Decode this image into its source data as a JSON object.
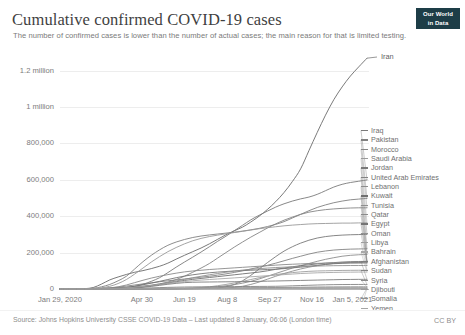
{
  "header": {
    "title": "Cumulative confirmed COVID-19 cases",
    "subtitle": "The number of confirmed cases is lower than the number of actual cases; the main reason for that is limited testing.",
    "logo_line1": "Our World",
    "logo_line2": "in Data"
  },
  "footer": {
    "source": "Source: Johns Hopkins University CSSE COVID-19 Data – Last updated 8 January, 06:06 (London time)",
    "license": "CC BY"
  },
  "highlight_label": "Iran",
  "chart_data": {
    "type": "line",
    "title": "Cumulative confirmed COVID-19 cases",
    "subtitle": "The number of confirmed cases is lower than the number of actual cases; the main reason for that is limited testing.",
    "xlabel": "",
    "ylabel": "",
    "grid": true,
    "legend_position": "right",
    "ylim": [
      0,
      1280000
    ],
    "ytick_labels": [
      "0",
      "200,000",
      "400,000",
      "600,000",
      "800,000",
      "1 million",
      "1.2 million"
    ],
    "ytick_values": [
      0,
      200000,
      400000,
      600000,
      800000,
      1000000,
      1200000
    ],
    "xtick_labels": [
      "Jan 29, 2020",
      "Apr 30",
      "Jun 19",
      "Aug 8",
      "Sep 27",
      "Nov 16",
      "Jan 5, 2021"
    ],
    "xtick_positions": [
      0,
      0.2685,
      0.4063,
      0.5441,
      0.6819,
      0.8197,
      0.9575
    ],
    "x_start": "Jan 29, 2020",
    "x_end": "Jan 5, 2021",
    "series": [
      {
        "name": "Iran",
        "color": "#6b6b6b",
        "end_value": 1268000,
        "values": [
          0,
          0,
          0,
          2000,
          8000,
          27000,
          50000,
          66000,
          80000,
          92000,
          101000,
          112000,
          125000,
          142000,
          164000,
          185000,
          205000,
          225000,
          248000,
          273000,
          298000,
          320000,
          340000,
          368000,
          400000,
          437000,
          480000,
          530000,
          590000,
          660000,
          760000,
          860000,
          955000,
          1040000,
          1110000,
          1170000,
          1220000,
          1268000
        ]
      },
      {
        "name": "Iraq",
        "color": "#7a7a7a",
        "end_value": 599000,
        "values": [
          0,
          0,
          0,
          200,
          800,
          1800,
          3000,
          5000,
          9000,
          15000,
          26000,
          42000,
          62000,
          90000,
          120000,
          148000,
          175000,
          203000,
          232000,
          262000,
          290000,
          320000,
          350000,
          380000,
          405000,
          428000,
          450000,
          468000,
          483000,
          495000,
          505000,
          520000,
          540000,
          560000,
          575000,
          585000,
          592000,
          599000
        ]
      },
      {
        "name": "Pakistan",
        "color": "#808080",
        "end_value": 498000,
        "values": [
          0,
          0,
          0,
          1000,
          4000,
          12000,
          25000,
          45000,
          70000,
          110000,
          150000,
          185000,
          215000,
          240000,
          258000,
          272000,
          283000,
          291000,
          297000,
          302000,
          307000,
          312000,
          318000,
          325000,
          333000,
          343000,
          355000,
          370000,
          390000,
          410000,
          430000,
          448000,
          462000,
          474000,
          483000,
          490000,
          494000,
          498000
        ]
      },
      {
        "name": "Morocco",
        "color": "#858585",
        "end_value": 446000,
        "values": [
          0,
          0,
          0,
          200,
          1000,
          3000,
          5000,
          7000,
          9000,
          12000,
          16000,
          21000,
          28000,
          38000,
          52000,
          70000,
          92000,
          115000,
          140000,
          170000,
          200000,
          230000,
          258000,
          285000,
          310000,
          335000,
          358000,
          378000,
          395000,
          410000,
          422000,
          430000,
          436000,
          440000,
          443000,
          445000,
          446000,
          446000
        ]
      },
      {
        "name": "Saudi Arabia",
        "color": "#9a9a9a",
        "end_value": 363000,
        "values": [
          0,
          0,
          0,
          500,
          2000,
          7000,
          15000,
          30000,
          52000,
          82000,
          115000,
          148000,
          178000,
          205000,
          228000,
          248000,
          265000,
          278000,
          288000,
          296000,
          303000,
          310000,
          317000,
          324000,
          331000,
          337000,
          342000,
          347000,
          351000,
          354000,
          357000,
          359000,
          360000,
          361000,
          362000,
          362000,
          363000,
          363000
        ]
      },
      {
        "name": "Jordan",
        "color": "#787878",
        "end_value": 300000,
        "values": [
          0,
          0,
          0,
          50,
          200,
          400,
          600,
          800,
          900,
          1000,
          1100,
          1200,
          1300,
          1400,
          1500,
          1700,
          2000,
          2500,
          3500,
          6000,
          12000,
          25000,
          45000,
          75000,
          110000,
          145000,
          178000,
          208000,
          232000,
          252000,
          268000,
          280000,
          288000,
          293000,
          296000,
          298000,
          299000,
          300000
        ]
      },
      {
        "name": "United Arab Emirates",
        "color": "#828282",
        "end_value": 221000,
        "values": [
          0,
          0,
          0,
          300,
          1200,
          3000,
          6000,
          10000,
          16000,
          22000,
          28000,
          34000,
          40000,
          45000,
          50000,
          55000,
          60000,
          65000,
          70000,
          76000,
          83000,
          91000,
          100000,
          110000,
          120000,
          130000,
          142000,
          155000,
          168000,
          180000,
          192000,
          202000,
          209000,
          214000,
          217000,
          219000,
          220000,
          221000
        ]
      },
      {
        "name": "Lebanon",
        "color": "#8c8c8c",
        "end_value": 190000,
        "values": [
          0,
          0,
          0,
          30,
          100,
          200,
          300,
          400,
          500,
          600,
          700,
          900,
          1200,
          1600,
          2200,
          3000,
          4200,
          6000,
          9000,
          13000,
          18000,
          24000,
          32000,
          42000,
          55000,
          70000,
          85000,
          100000,
          115000,
          128000,
          140000,
          152000,
          163000,
          172000,
          180000,
          185000,
          188000,
          190000
        ]
      },
      {
        "name": "Kuwait",
        "color": "#6f6f6f",
        "end_value": 152000,
        "values": [
          0,
          0,
          0,
          100,
          400,
          900,
          1500,
          2500,
          4000,
          7000,
          12000,
          18000,
          25000,
          33000,
          40000,
          47000,
          53000,
          58000,
          63000,
          68000,
          73000,
          78000,
          83000,
          88000,
          93000,
          100000,
          108000,
          115000,
          122000,
          128000,
          133000,
          138000,
          142000,
          145000,
          148000,
          150000,
          151000,
          152000
        ]
      },
      {
        "name": "Tunisia",
        "color": "#8f8f8f",
        "end_value": 149000,
        "values": [
          0,
          0,
          0,
          50,
          200,
          500,
          800,
          1000,
          1100,
          1150,
          1200,
          1250,
          1300,
          1350,
          1400,
          1500,
          1700,
          2000,
          2500,
          3500,
          5500,
          9000,
          15000,
          25000,
          38000,
          54000,
          70000,
          85000,
          98000,
          110000,
          120000,
          128000,
          135000,
          141000,
          145000,
          147000,
          148000,
          149000
        ]
      },
      {
        "name": "Qatar",
        "color": "#8a8a8a",
        "end_value": 144000,
        "values": [
          0,
          0,
          0,
          200,
          800,
          2500,
          6000,
          12000,
          22000,
          35000,
          48000,
          60000,
          70000,
          79000,
          87000,
          94000,
          99000,
          103000,
          107000,
          110000,
          113000,
          116000,
          119000,
          122000,
          125000,
          128000,
          131000,
          134000,
          136000,
          138000,
          140000,
          141000,
          142000,
          143000,
          143500,
          144000,
          144000,
          144000
        ]
      },
      {
        "name": "Egypt",
        "color": "#747474",
        "end_value": 144000,
        "values": [
          0,
          0,
          0,
          100,
          400,
          1000,
          2500,
          5000,
          9000,
          15000,
          23000,
          32000,
          42000,
          52000,
          62000,
          71000,
          78000,
          84000,
          89000,
          93000,
          96000,
          99000,
          101000,
          103000,
          105000,
          107000,
          109000,
          112000,
          116000,
          120000,
          125000,
          130000,
          135000,
          139000,
          141000,
          143000,
          143500,
          144000
        ]
      },
      {
        "name": "Oman",
        "color": "#909090",
        "end_value": 129000,
        "values": [
          0,
          0,
          0,
          80,
          300,
          800,
          1500,
          3000,
          5500,
          9000,
          14000,
          20000,
          27000,
          35000,
          44000,
          53000,
          62000,
          70000,
          78000,
          85000,
          92000,
          98000,
          104000,
          108000,
          112000,
          115000,
          118000,
          120000,
          122000,
          124000,
          125000,
          126000,
          127000,
          128000,
          128500,
          129000,
          129000,
          129000
        ]
      },
      {
        "name": "Libya",
        "color": "#9e9e9e",
        "end_value": 103000,
        "values": [
          0,
          0,
          0,
          0,
          20,
          50,
          80,
          100,
          130,
          180,
          250,
          400,
          700,
          1200,
          2000,
          3200,
          5000,
          8000,
          12000,
          18000,
          25000,
          33000,
          42000,
          52000,
          62000,
          71000,
          79000,
          85000,
          90000,
          94000,
          97000,
          99000,
          100000,
          101000,
          102000,
          102500,
          103000,
          103000
        ]
      },
      {
        "name": "Bahrain",
        "color": "#a8a8a8",
        "end_value": 93000,
        "values": [
          0,
          0,
          0,
          100,
          400,
          1000,
          2000,
          3500,
          6000,
          9000,
          13000,
          18000,
          24000,
          30000,
          36000,
          41000,
          45000,
          49000,
          52000,
          55000,
          58000,
          61000,
          64000,
          67000,
          70000,
          73000,
          76000,
          79000,
          82000,
          85000,
          87000,
          89000,
          90000,
          91000,
          92000,
          92500,
          93000,
          93000
        ]
      },
      {
        "name": "Afghanistan",
        "color": "#7d7d7d",
        "end_value": 53000,
        "values": [
          0,
          0,
          0,
          20,
          80,
          200,
          500,
          1200,
          2500,
          5000,
          9000,
          14000,
          20000,
          26000,
          31000,
          35000,
          37000,
          38000,
          38500,
          39000,
          39500,
          40000,
          40500,
          41000,
          42000,
          43000,
          44000,
          45000,
          46000,
          47000,
          48000,
          49000,
          50000,
          51000,
          52000,
          52500,
          53000,
          53000
        ]
      },
      {
        "name": "Sudan",
        "color": "#858585",
        "end_value": 25000,
        "values": [
          0,
          0,
          0,
          0,
          20,
          80,
          200,
          500,
          1000,
          2000,
          3500,
          5500,
          7500,
          9000,
          10000,
          11000,
          11500,
          12000,
          12300,
          12600,
          13000,
          13300,
          13600,
          13900,
          14200,
          14500,
          15000,
          16000,
          17500,
          19000,
          20500,
          22000,
          23000,
          24000,
          24500,
          24800,
          25000,
          25000
        ]
      },
      {
        "name": "Syria",
        "color": "#8b8b8b",
        "end_value": 12000,
        "values": [
          0,
          0,
          0,
          0,
          10,
          30,
          60,
          100,
          200,
          300,
          450,
          700,
          1000,
          1400,
          1800,
          2300,
          2800,
          3400,
          4000,
          4600,
          5200,
          5800,
          6300,
          6800,
          7300,
          7800,
          8300,
          8800,
          9300,
          9800,
          10300,
          10800,
          11200,
          11500,
          11700,
          11900,
          12000,
          12000
        ]
      },
      {
        "name": "Djibouti",
        "color": "#9b9b9b",
        "end_value": 5900,
        "values": [
          0,
          0,
          0,
          0,
          50,
          300,
          900,
          1800,
          2700,
          3500,
          4000,
          4300,
          4500,
          4700,
          4900,
          5000,
          5100,
          5200,
          5250,
          5300,
          5350,
          5400,
          5450,
          5500,
          5550,
          5600,
          5650,
          5700,
          5750,
          5800,
          5820,
          5840,
          5860,
          5870,
          5880,
          5890,
          5900,
          5900
        ]
      },
      {
        "name": "Somalia",
        "color": "#909090",
        "end_value": 4800,
        "values": [
          0,
          0,
          0,
          0,
          20,
          100,
          400,
          900,
          1600,
          2300,
          2800,
          3100,
          3300,
          3400,
          3450,
          3500,
          3550,
          3600,
          3650,
          3700,
          3750,
          3800,
          3850,
          3900,
          3950,
          4000,
          4100,
          4200,
          4300,
          4400,
          4500,
          4600,
          4650,
          4700,
          4750,
          4780,
          4800,
          4800
        ]
      },
      {
        "name": "Yemen",
        "color": "#a5a5a5",
        "end_value": 2100,
        "values": [
          0,
          0,
          0,
          0,
          0,
          20,
          80,
          250,
          600,
          1000,
          1300,
          1500,
          1600,
          1700,
          1750,
          1800,
          1850,
          1900,
          1930,
          1950,
          1970,
          1990,
          2000,
          2010,
          2020,
          2030,
          2040,
          2050,
          2060,
          2070,
          2080,
          2085,
          2090,
          2095,
          2098,
          2099,
          2100,
          2100
        ]
      }
    ]
  }
}
